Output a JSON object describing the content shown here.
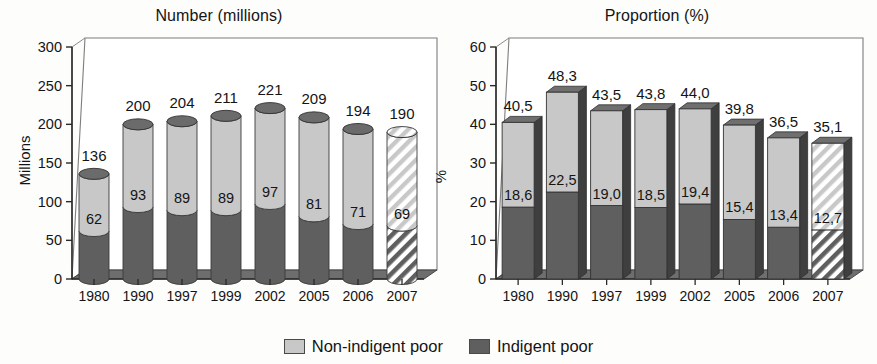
{
  "chart_data": [
    {
      "type": "bar",
      "subtype": "stacked-cylinder-3d",
      "title": "Number (millions)",
      "xlabel": "",
      "ylabel": "Millions",
      "categories": [
        "1980",
        "1990",
        "1997",
        "1999",
        "2002",
        "2005",
        "2006",
        "2007"
      ],
      "ylim": [
        0,
        300
      ],
      "yticks": [
        "0",
        "50",
        "100",
        "150",
        "200",
        "250",
        "300"
      ],
      "ytick_values": [
        0,
        50,
        100,
        150,
        200,
        250,
        300
      ],
      "grid": false,
      "legend_position": "bottom-center",
      "series": [
        {
          "name": "Indigent poor",
          "color": "#5f5f5f",
          "values": [
            62,
            93,
            89,
            89,
            97,
            81,
            71,
            69
          ],
          "labels": [
            "62",
            "93",
            "89",
            "89",
            "97",
            "81",
            "71",
            "69"
          ]
        },
        {
          "name": "Non-indigent poor",
          "color": "#c8c8c8",
          "values": [
            74,
            107,
            115,
            122,
            124,
            128,
            123,
            121
          ],
          "labels": [
            "",
            "",
            "",
            "",
            "",
            "",
            "",
            ""
          ]
        }
      ],
      "totals": [
        136,
        200,
        204,
        211,
        221,
        209,
        194,
        190
      ],
      "total_labels": [
        "136",
        "200",
        "204",
        "211",
        "221",
        "209",
        "194",
        "190"
      ],
      "projected_categories": [
        "2007"
      ],
      "annotations": []
    },
    {
      "type": "bar",
      "subtype": "stacked-bar-3d",
      "title": "Proportion (%)",
      "xlabel": "",
      "ylabel": "%",
      "categories": [
        "1980",
        "1990",
        "1997",
        "1999",
        "2002",
        "2005",
        "2006",
        "2007"
      ],
      "ylim": [
        0,
        60
      ],
      "yticks": [
        "0",
        "10",
        "20",
        "30",
        "40",
        "50",
        "60"
      ],
      "ytick_values": [
        0,
        10,
        20,
        30,
        40,
        50,
        60
      ],
      "grid": false,
      "legend_position": "bottom-center",
      "series": [
        {
          "name": "Indigent poor",
          "color": "#5f5f5f",
          "values": [
            18.6,
            22.5,
            19.0,
            18.5,
            19.4,
            15.4,
            13.4,
            12.7
          ],
          "labels": [
            "18,6",
            "22,5",
            "19,0",
            "18,5",
            "19,4",
            "15,4",
            "13,4",
            "12,7"
          ]
        },
        {
          "name": "Non-indigent poor",
          "color": "#c8c8c8",
          "values": [
            21.9,
            25.8,
            24.5,
            25.3,
            24.6,
            24.4,
            23.1,
            22.4
          ],
          "labels": [
            "",
            "",
            "",
            "",
            "",
            "",
            "",
            ""
          ]
        }
      ],
      "totals": [
        40.5,
        48.3,
        43.5,
        43.8,
        44.0,
        39.8,
        36.5,
        35.1
      ],
      "total_labels": [
        "40,5",
        "48,3",
        "43,5",
        "43,8",
        "44,0",
        "39,8",
        "36,5",
        "35,1"
      ],
      "projected_categories": [
        "2007"
      ],
      "annotations": []
    }
  ],
  "legend": {
    "items": [
      {
        "label": "Non-indigent poor",
        "color": "#c8c8c8"
      },
      {
        "label": "Indigent poor",
        "color": "#5f5f5f"
      }
    ]
  },
  "colors": {
    "indigent": "#5f5f5f",
    "non_indigent": "#c8c8c8",
    "axis": "#2a2a2a",
    "text": "#141414",
    "floor": "#6e6e6e",
    "hatch_line": "#555555"
  }
}
